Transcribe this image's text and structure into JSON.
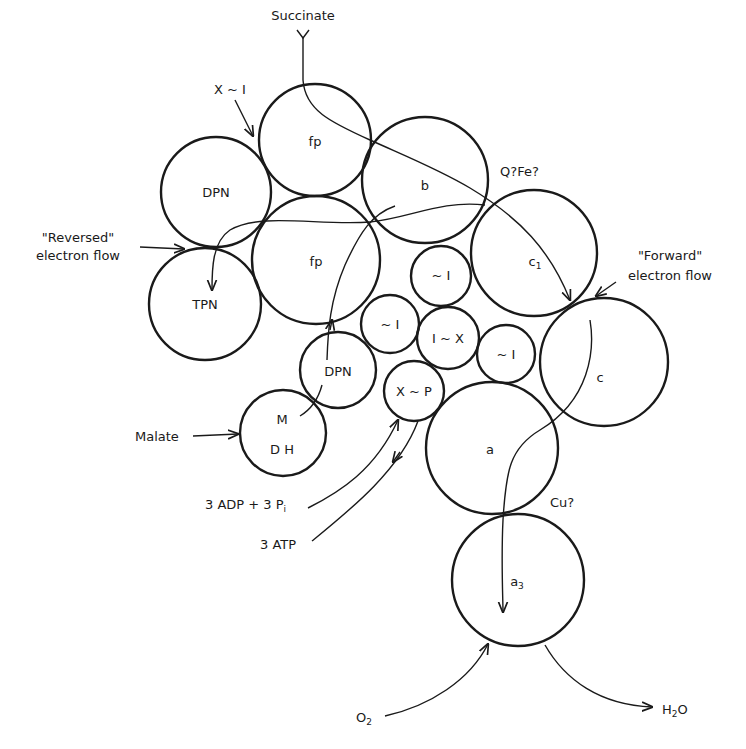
{
  "diagram": {
    "type": "electron-transport-chain",
    "components": {
      "fp_top": "fp",
      "dpn_left": "DPN",
      "b": "b",
      "fp_mid": "fp",
      "tpn": "TPN",
      "c1_main": "c",
      "c1_sub": "1",
      "i_top": "~ I",
      "i_left": "~ I",
      "ix": "I ~ X",
      "i_right": "~ I",
      "c": "c",
      "dpn_lower": "DPN",
      "mdh_top": "M",
      "mdh_bottom": "D H",
      "xp": "X ~ P",
      "a": "a",
      "a3_main": "a",
      "a3_sub": "3"
    },
    "labels": {
      "succinate": "Succinate",
      "x_i": "X ~ I",
      "qfe": "Q?Fe?",
      "reversed_1": "\"Reversed\"",
      "reversed_2": "electron flow",
      "forward_1": "\"Forward\"",
      "forward_2": "electron flow",
      "malate": "Malate",
      "adp": "3 ADP + 3 P",
      "adp_sub": "i",
      "atp": "3 ATP",
      "cu": "Cu?",
      "o2_main": "O",
      "o2_sub": "2",
      "h2o_h": "H",
      "h2o_sub": "2",
      "h2o_o": "O"
    }
  }
}
